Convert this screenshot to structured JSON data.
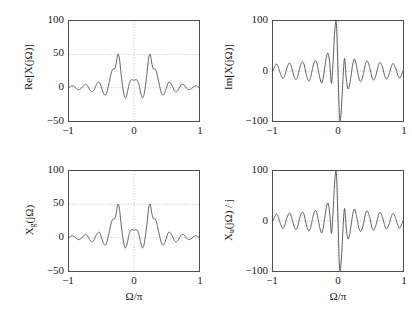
{
  "figure": {
    "background": "#ffffff",
    "curve_color": "#3a3a3a",
    "axis_color": "#4d4d4d",
    "grid_color": "#9a9a9a"
  },
  "panels": [
    {
      "id": "top-left",
      "ylabel_main": "Re[X(jΩ)]",
      "ylabel_plain": "Re[X(jOmega)]",
      "yticks": [
        "100",
        "50",
        "0",
        "−50"
      ],
      "xticks": [
        "−1",
        "0",
        "1"
      ],
      "xlabel": ""
    },
    {
      "id": "top-right",
      "ylabel_main": "Im[X(jΩ)]",
      "ylabel_plain": "Im[X(jOmega)]",
      "yticks": [
        "100",
        "0",
        "−100"
      ],
      "xticks": [
        "−1",
        "0",
        "1"
      ],
      "xlabel": ""
    },
    {
      "id": "bottom-left",
      "ylabel_main": "X",
      "ylabel_sub": "g",
      "ylabel_tail": "(jΩ)",
      "ylabel_plain": "X_g(jOmega)",
      "yticks": [
        "100",
        "50",
        "0",
        "−50"
      ],
      "xticks": [
        "−1",
        "0",
        "1"
      ],
      "xlabel": "Ω/π"
    },
    {
      "id": "bottom-right",
      "ylabel_main": "X",
      "ylabel_sub": "u",
      "ylabel_tail": "(jΩ) / j",
      "ylabel_plain": "X_u(jOmega) / j",
      "yticks": [
        "100",
        "0",
        "−100"
      ],
      "xticks": [
        "−1",
        "0",
        "1"
      ],
      "xlabel": "Ω/π"
    }
  ],
  "chart_data": [
    {
      "type": "line",
      "title": "",
      "subplot": "top-left",
      "xlabel": "",
      "ylabel": "Re[X(jΩ)]",
      "xlim": [
        -1,
        1
      ],
      "ylim": [
        -50,
        100
      ],
      "xticks": [
        -1,
        0,
        1
      ],
      "yticks": [
        -50,
        0,
        50,
        100
      ],
      "grid": true,
      "description": "Even (symmetric) real part of the spectrum: two dominant lobes of height ~50 at Ω/π = ±0.25, a secondary central lobe of ~12 at 0, negative dips to ~−15 near ±0.12 and ±0.38, and decaying ripples toward ±1.",
      "x": [
        -1.0,
        -0.975,
        -0.95,
        -0.925,
        -0.9,
        -0.875,
        -0.85,
        -0.825,
        -0.8,
        -0.775,
        -0.75,
        -0.725,
        -0.7,
        -0.675,
        -0.65,
        -0.625,
        -0.6,
        -0.575,
        -0.55,
        -0.525,
        -0.5,
        -0.475,
        -0.45,
        -0.425,
        -0.4,
        -0.375,
        -0.35,
        -0.325,
        -0.3,
        -0.275,
        -0.25,
        -0.225,
        -0.2,
        -0.175,
        -0.15,
        -0.125,
        -0.1,
        -0.075,
        -0.05,
        -0.025,
        0.0,
        0.025,
        0.05,
        0.075,
        0.1,
        0.125,
        0.15,
        0.175,
        0.2,
        0.225,
        0.25,
        0.275,
        0.3,
        0.325,
        0.35,
        0.375,
        0.4,
        0.425,
        0.45,
        0.475,
        0.5,
        0.525,
        0.55,
        0.575,
        0.6,
        0.625,
        0.65,
        0.675,
        0.7,
        0.725,
        0.75,
        0.775,
        0.8,
        0.825,
        0.85,
        0.875,
        0.9,
        0.925,
        0.95,
        0.975,
        1.0
      ],
      "y": [
        0,
        2,
        3,
        2,
        0,
        -2,
        -3,
        -2,
        0,
        3,
        5,
        4,
        0,
        -4,
        -6,
        -5,
        0,
        5,
        8,
        7,
        0,
        -7,
        -11,
        -9,
        0,
        11,
        22,
        28,
        28,
        36,
        50,
        44,
        22,
        2,
        -12,
        -15,
        -6,
        5,
        11,
        12,
        11,
        12,
        11,
        5,
        -6,
        -15,
        -12,
        2,
        22,
        44,
        50,
        36,
        28,
        28,
        22,
        11,
        0,
        -9,
        -11,
        -7,
        0,
        7,
        8,
        5,
        0,
        -5,
        -6,
        -4,
        0,
        4,
        5,
        4,
        0,
        -2,
        -3,
        -2,
        0,
        2,
        3,
        2,
        0
      ]
    },
    {
      "type": "line",
      "title": "",
      "subplot": "top-right",
      "xlabel": "",
      "ylabel": "Im[X(jΩ)]",
      "xlim": [
        -1,
        1
      ],
      "ylim": [
        -100,
        100
      ],
      "xticks": [
        -1,
        0,
        1
      ],
      "yticks": [
        -100,
        0,
        100
      ],
      "grid": true,
      "description": "Odd (antisymmetric) imaginary part: sharp positive peak ~95 just left of Ω/π = −0.04 and mirrored negative trough ~−95 just right of 0, secondary lobes ~35 at ±0.15, with decaying oscillatory ripples of amplitude ~15 extending to ±1.",
      "x": [
        -1.0,
        -0.975,
        -0.95,
        -0.925,
        -0.9,
        -0.875,
        -0.85,
        -0.825,
        -0.8,
        -0.775,
        -0.75,
        -0.725,
        -0.7,
        -0.675,
        -0.65,
        -0.625,
        -0.6,
        -0.575,
        -0.55,
        -0.525,
        -0.5,
        -0.475,
        -0.45,
        -0.425,
        -0.4,
        -0.375,
        -0.35,
        -0.325,
        -0.3,
        -0.275,
        -0.25,
        -0.225,
        -0.2,
        -0.175,
        -0.15,
        -0.125,
        -0.1,
        -0.075,
        -0.05,
        -0.025,
        0.0,
        0.025,
        0.05,
        0.075,
        0.1,
        0.125,
        0.15,
        0.175,
        0.2,
        0.225,
        0.25,
        0.275,
        0.3,
        0.325,
        0.35,
        0.375,
        0.4,
        0.425,
        0.45,
        0.475,
        0.5,
        0.525,
        0.55,
        0.575,
        0.6,
        0.625,
        0.65,
        0.675,
        0.7,
        0.725,
        0.75,
        0.775,
        0.8,
        0.825,
        0.85,
        0.875,
        0.9,
        0.925,
        0.95,
        0.975,
        1.0
      ],
      "y": [
        0,
        8,
        14,
        10,
        0,
        -9,
        -15,
        -11,
        0,
        10,
        16,
        12,
        0,
        -11,
        -17,
        -13,
        0,
        12,
        18,
        14,
        0,
        -13,
        -20,
        -15,
        0,
        14,
        21,
        16,
        0,
        -16,
        -24,
        -12,
        10,
        30,
        35,
        12,
        -25,
        20,
        80,
        95,
        0,
        -95,
        -80,
        -20,
        25,
        -12,
        -35,
        -30,
        -10,
        12,
        24,
        16,
        0,
        -16,
        -21,
        -14,
        0,
        15,
        20,
        13,
        0,
        -14,
        -18,
        -12,
        0,
        13,
        17,
        11,
        0,
        -12,
        -16,
        -10,
        0,
        11,
        15,
        9,
        0,
        -10,
        -14,
        -8,
        0
      ]
    },
    {
      "type": "line",
      "title": "",
      "subplot": "bottom-left",
      "xlabel": "Ω/π",
      "ylabel": "X_g(jΩ)",
      "xlim": [
        -1,
        1
      ],
      "ylim": [
        -50,
        100
      ],
      "xticks": [
        -1,
        0,
        1
      ],
      "yticks": [
        -50,
        0,
        50,
        100
      ],
      "grid": true,
      "description": "Even part X_g(jΩ) of the signal transform — identical to Re[X(jΩ)] in the top-left panel: twin lobes of ~50 at ±0.25 and a central lobe of ~12.",
      "x": [
        -1.0,
        -0.975,
        -0.95,
        -0.925,
        -0.9,
        -0.875,
        -0.85,
        -0.825,
        -0.8,
        -0.775,
        -0.75,
        -0.725,
        -0.7,
        -0.675,
        -0.65,
        -0.625,
        -0.6,
        -0.575,
        -0.55,
        -0.525,
        -0.5,
        -0.475,
        -0.45,
        -0.425,
        -0.4,
        -0.375,
        -0.35,
        -0.325,
        -0.3,
        -0.275,
        -0.25,
        -0.225,
        -0.2,
        -0.175,
        -0.15,
        -0.125,
        -0.1,
        -0.075,
        -0.05,
        -0.025,
        0.0,
        0.025,
        0.05,
        0.075,
        0.1,
        0.125,
        0.15,
        0.175,
        0.2,
        0.225,
        0.25,
        0.275,
        0.3,
        0.325,
        0.35,
        0.375,
        0.4,
        0.425,
        0.45,
        0.475,
        0.5,
        0.525,
        0.55,
        0.575,
        0.6,
        0.625,
        0.65,
        0.675,
        0.7,
        0.725,
        0.75,
        0.775,
        0.8,
        0.825,
        0.85,
        0.875,
        0.9,
        0.925,
        0.95,
        0.975,
        1.0
      ],
      "y": [
        0,
        2,
        3,
        2,
        0,
        -2,
        -3,
        -2,
        0,
        3,
        5,
        4,
        0,
        -4,
        -6,
        -5,
        0,
        5,
        8,
        7,
        0,
        -7,
        -11,
        -9,
        0,
        11,
        22,
        28,
        28,
        36,
        50,
        44,
        22,
        2,
        -12,
        -15,
        -6,
        5,
        11,
        12,
        11,
        12,
        11,
        5,
        -6,
        -15,
        -12,
        2,
        22,
        44,
        50,
        36,
        28,
        28,
        22,
        11,
        0,
        -9,
        -11,
        -7,
        0,
        7,
        8,
        5,
        0,
        -5,
        -6,
        -4,
        0,
        4,
        5,
        4,
        0,
        -2,
        -3,
        -2,
        0,
        2,
        3,
        2,
        0
      ]
    },
    {
      "type": "line",
      "title": "",
      "subplot": "bottom-right",
      "xlabel": "Ω/π",
      "ylabel": "X_u(jΩ) / j",
      "xlim": [
        -1,
        1
      ],
      "ylim": [
        -100,
        100
      ],
      "xticks": [
        -1,
        0,
        1
      ],
      "yticks": [
        -100,
        0,
        100
      ],
      "grid": true,
      "description": "Odd part X_u(jΩ) divided by j — identical to Im[X(jΩ)] in the top-right panel: sharp ±95 excursions about the origin with decaying ripples.",
      "x": [
        -1.0,
        -0.975,
        -0.95,
        -0.925,
        -0.9,
        -0.875,
        -0.85,
        -0.825,
        -0.8,
        -0.775,
        -0.75,
        -0.725,
        -0.7,
        -0.675,
        -0.65,
        -0.625,
        -0.6,
        -0.575,
        -0.55,
        -0.525,
        -0.5,
        -0.475,
        -0.45,
        -0.425,
        -0.4,
        -0.375,
        -0.35,
        -0.325,
        -0.3,
        -0.275,
        -0.25,
        -0.225,
        -0.2,
        -0.175,
        -0.15,
        -0.125,
        -0.1,
        -0.075,
        -0.05,
        -0.025,
        0.0,
        0.025,
        0.05,
        0.075,
        0.1,
        0.125,
        0.15,
        0.175,
        0.2,
        0.225,
        0.25,
        0.275,
        0.3,
        0.325,
        0.35,
        0.375,
        0.4,
        0.425,
        0.45,
        0.475,
        0.5,
        0.525,
        0.55,
        0.575,
        0.6,
        0.625,
        0.65,
        0.675,
        0.7,
        0.725,
        0.75,
        0.775,
        0.8,
        0.825,
        0.85,
        0.875,
        0.9,
        0.925,
        0.95,
        0.975,
        1.0
      ],
      "y": [
        0,
        8,
        14,
        10,
        0,
        -9,
        -15,
        -11,
        0,
        10,
        16,
        12,
        0,
        -11,
        -17,
        -13,
        0,
        12,
        18,
        14,
        0,
        -13,
        -20,
        -15,
        0,
        14,
        21,
        16,
        0,
        -16,
        -24,
        -12,
        10,
        30,
        35,
        12,
        -25,
        20,
        80,
        95,
        0,
        -95,
        -80,
        -20,
        25,
        -12,
        -35,
        -30,
        -10,
        12,
        24,
        16,
        0,
        -16,
        -21,
        -14,
        0,
        15,
        20,
        13,
        0,
        -14,
        -18,
        -12,
        0,
        13,
        17,
        11,
        0,
        -12,
        -16,
        -10,
        0,
        11,
        15,
        9,
        0,
        -10,
        -14,
        -8,
        0
      ]
    }
  ]
}
